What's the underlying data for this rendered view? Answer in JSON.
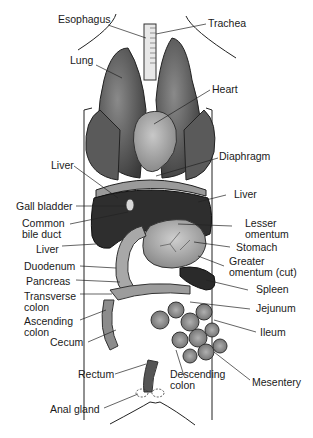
{
  "diagram": {
    "type": "anatomical",
    "labels": [
      {
        "id": "esophagus",
        "text": "Esophagus"
      },
      {
        "id": "trachea",
        "text": "Trachea"
      },
      {
        "id": "lung",
        "text": "Lung"
      },
      {
        "id": "heart",
        "text": "Heart"
      },
      {
        "id": "diaphragm",
        "text": "Diaphragm"
      },
      {
        "id": "liver_upper_left",
        "text": "Liver"
      },
      {
        "id": "liver_right",
        "text": "Liver"
      },
      {
        "id": "gall_bladder",
        "text": "Gall bladder"
      },
      {
        "id": "common_bile_duct",
        "text": "Common\nbile duct",
        "line1": "Common",
        "line2": "bile duct"
      },
      {
        "id": "lesser_omentum",
        "text": "Lesser\nomentum",
        "line1": "Lesser",
        "line2": "omentum"
      },
      {
        "id": "stomach",
        "text": "Stomach"
      },
      {
        "id": "liver_lower_left",
        "text": "Liver"
      },
      {
        "id": "greater_omentum",
        "text": "Greater\nomentum (cut)",
        "line1": "Greater",
        "line2": "omentum (cut)"
      },
      {
        "id": "duodenum",
        "text": "Duodenum"
      },
      {
        "id": "pancreas",
        "text": "Pancreas"
      },
      {
        "id": "spleen",
        "text": "Spleen"
      },
      {
        "id": "transverse_colon",
        "text": "Transverse\ncolon",
        "line1": "Transverse",
        "line2": "colon"
      },
      {
        "id": "jejunum",
        "text": "Jejunum"
      },
      {
        "id": "ascending_colon",
        "text": "Ascending\ncolon",
        "line1": "Ascending",
        "line2": "colon"
      },
      {
        "id": "ileum",
        "text": "Ileum"
      },
      {
        "id": "cecum",
        "text": "Cecum"
      },
      {
        "id": "rectum",
        "text": "Rectum"
      },
      {
        "id": "descending_colon",
        "text": "Descending\ncolon",
        "line1": "Descending",
        "line2": "colon"
      },
      {
        "id": "mesentery",
        "text": "Mesentery"
      },
      {
        "id": "anal_gland",
        "text": "Anal gland"
      }
    ]
  }
}
